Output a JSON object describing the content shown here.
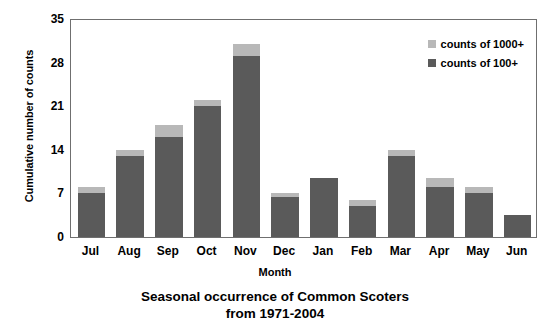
{
  "chart_data": {
    "type": "bar",
    "title": "Seasonal occurrence of Common Scoters",
    "subtitle": "from 1971-2004",
    "xlabel": "Month",
    "ylabel": "Cumulative number of counts",
    "categories": [
      "Jul",
      "Aug",
      "Sep",
      "Oct",
      "Nov",
      "Dec",
      "Jan",
      "Feb",
      "Mar",
      "Apr",
      "May",
      "Jun"
    ],
    "series": [
      {
        "name": "counts of 100+",
        "color": "#5a5a5a",
        "values": [
          7,
          13,
          16,
          21,
          29,
          6.5,
          9.5,
          5,
          13,
          8,
          7,
          3.5
        ]
      },
      {
        "name": "counts of 1000+",
        "color": "#b8b8b8",
        "values": [
          1,
          1,
          2,
          1,
          2,
          0.5,
          0,
          1,
          1,
          1.5,
          1,
          0
        ]
      }
    ],
    "totals": [
      8,
      14,
      18,
      22,
      31,
      7,
      9.5,
      6,
      14,
      9.5,
      8,
      3.5
    ],
    "stacked": true,
    "ylim": [
      0,
      35
    ],
    "yticks": [
      35,
      28,
      21,
      14,
      7,
      0
    ],
    "grid": false,
    "legend_position": "top-right",
    "legend": [
      {
        "label": "counts of 1000+",
        "color": "#b8b8b8",
        "swatch": "light"
      },
      {
        "label": "counts of 100+",
        "color": "#5a5a5a",
        "swatch": "dark"
      }
    ]
  }
}
